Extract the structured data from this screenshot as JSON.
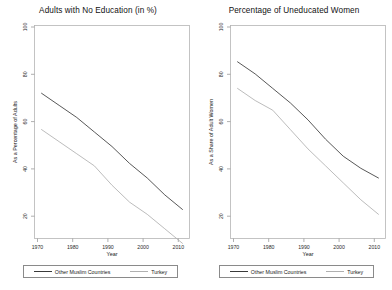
{
  "chart_data": [
    {
      "type": "line",
      "title": "Adults with No Education (in %)",
      "xlabel": "Year",
      "ylabel": "As a Percentage of Adults",
      "xlim": [
        1968,
        2012
      ],
      "ylim": [
        15,
        103
      ],
      "xticks": [
        "1970",
        "1980",
        "1990",
        "2000",
        "2010"
      ],
      "xtick_values": [
        1970,
        1980,
        1990,
        2000,
        2010
      ],
      "yticks": [
        "20",
        "40",
        "60",
        "80",
        "100"
      ],
      "ytick_values": [
        20,
        40,
        60,
        80,
        100
      ],
      "grid": false,
      "legend_position": "bottom",
      "x": [
        1970,
        1975,
        1980,
        1985,
        1990,
        1995,
        2000,
        2005,
        2010
      ],
      "series": [
        {
          "name": "Other Muslim Countries",
          "color": "#3a3a3a",
          "values": [
            75,
            70,
            65,
            59,
            53,
            46,
            40,
            33,
            27
          ]
        },
        {
          "name": "Turkey",
          "color": "#b0b0b0",
          "values": [
            60,
            55,
            50,
            45,
            37,
            30,
            25,
            19,
            13
          ]
        }
      ]
    },
    {
      "type": "line",
      "title": "Percentage of Uneducated Women",
      "xlabel": "Year",
      "ylabel": "As a Share of Adult Women",
      "xlim": [
        1968,
        2012
      ],
      "ylim": [
        15,
        103
      ],
      "xticks": [
        "1970",
        "1980",
        "1990",
        "2000",
        "2010"
      ],
      "xtick_values": [
        1970,
        1980,
        1990,
        2000,
        2010
      ],
      "yticks": [
        "20",
        "40",
        "60",
        "80",
        "100"
      ],
      "ytick_values": [
        20,
        40,
        60,
        80,
        100
      ],
      "grid": false,
      "legend_position": "bottom",
      "x": [
        1970,
        1975,
        1980,
        1985,
        1990,
        1995,
        2000,
        2005,
        2010
      ],
      "series": [
        {
          "name": "Other Muslim Countries",
          "color": "#3a3a3a",
          "values": [
            88,
            83,
            77,
            71,
            64,
            56,
            49,
            44,
            40
          ]
        },
        {
          "name": "Turkey",
          "color": "#b0b0b0",
          "values": [
            77,
            72,
            68,
            60,
            52,
            45,
            38,
            31,
            25
          ]
        }
      ]
    }
  ],
  "panels": [
    {
      "title": "Adults with No Education (in %)",
      "ylabel": "As a Percentage of Adults",
      "xlabel": "Year",
      "ytick_labels": [
        "100",
        "80",
        "60",
        "40",
        "20"
      ],
      "xtick_labels": [
        "1970",
        "1980",
        "1990",
        "2000",
        "2010"
      ],
      "legend": [
        {
          "label": "Other Muslim Countries",
          "color": "#3a3a3a"
        },
        {
          "label": "Turkey",
          "color": "#b0b0b0"
        }
      ]
    },
    {
      "title": "Percentage of Uneducated Women",
      "ylabel": "As a Share of Adult Women",
      "xlabel": "Year",
      "ytick_labels": [
        "100",
        "80",
        "60",
        "40",
        "20"
      ],
      "xtick_labels": [
        "1970",
        "1980",
        "1990",
        "2000",
        "2010"
      ],
      "legend": [
        {
          "label": "Other Muslim Countries",
          "color": "#3a3a3a"
        },
        {
          "label": "Turkey",
          "color": "#b0b0b0"
        }
      ]
    }
  ]
}
